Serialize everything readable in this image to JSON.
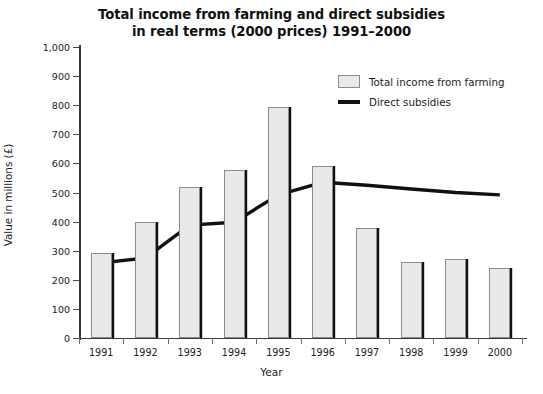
{
  "chart_data": {
    "type": "bar",
    "title": "Total income from farming and direct subsidies in real terms (2000 prices) 1991–2000",
    "title_line1": "Total income from farming and direct subsidies",
    "title_line2": "in real terms (2000 prices) 1991–2000",
    "xlabel": "Year",
    "ylabel": "Value in millions (£)",
    "categories": [
      "1991",
      "1992",
      "1993",
      "1994",
      "1995",
      "1996",
      "1997",
      "1998",
      "1999",
      "2000"
    ],
    "ylim": [
      0,
      1000
    ],
    "ytick_values": [
      0,
      100,
      200,
      300,
      400,
      500,
      600,
      700,
      800,
      900,
      1000
    ],
    "ytick_labels": [
      "0",
      "100",
      "200",
      "300",
      "400",
      "500",
      "600",
      "700",
      "800",
      "900",
      "1,000"
    ],
    "grid": false,
    "legend_position": "top-right",
    "series": [
      {
        "name": "Total income from farming",
        "type": "bar",
        "color": "#e9e9e9",
        "edge_color": "#8c8c8c",
        "values": [
          292,
          400,
          518,
          578,
          795,
          590,
          378,
          262,
          272,
          242
        ]
      },
      {
        "name": "Direct subsidies",
        "type": "line",
        "color": "#111111",
        "values": [
          258,
          275,
          388,
          398,
          492,
          535,
          525,
          512,
          500,
          492
        ]
      }
    ]
  },
  "legend": {
    "items": [
      {
        "label": "Total income from farming",
        "marker": "bar-swatch"
      },
      {
        "label": "Direct subsidies",
        "marker": "line-swatch"
      }
    ]
  }
}
